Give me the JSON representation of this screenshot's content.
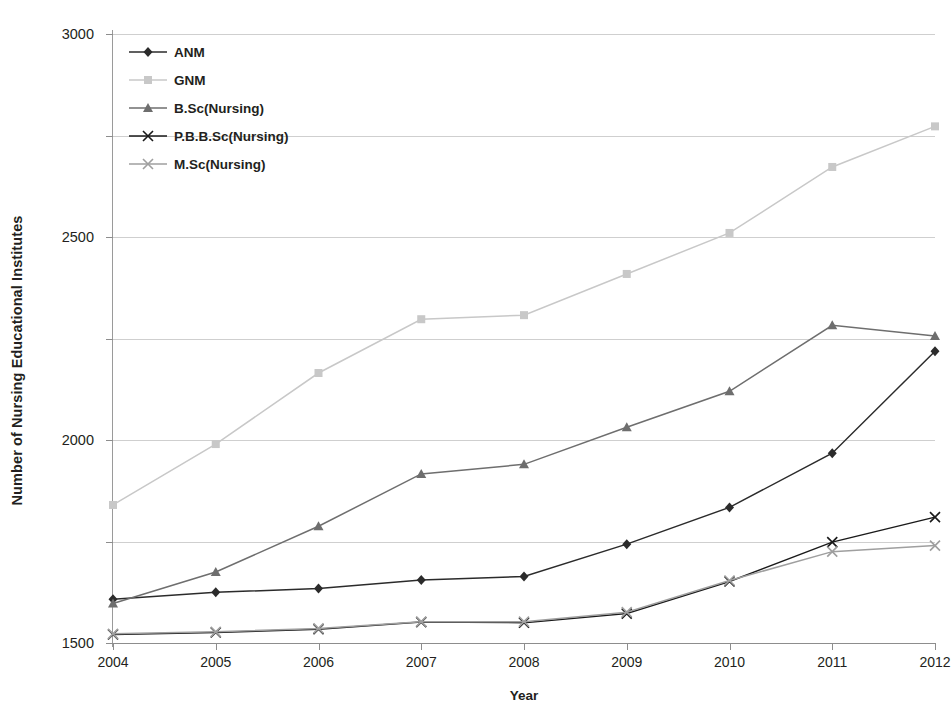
{
  "chart_data": {
    "type": "line",
    "title": "",
    "xlabel": "Year",
    "ylabel": "Number of Nursing Educational Institutes",
    "categories": [
      "2004",
      "2005",
      "2006",
      "2007",
      "2008",
      "2009",
      "2010",
      "2011",
      "2012"
    ],
    "x": [
      2004,
      2005,
      2006,
      2007,
      2008,
      2009,
      2010,
      2011,
      2012
    ],
    "ylim": [
      0,
      3000
    ],
    "yticks": [
      0,
      500,
      1000,
      1500,
      2000,
      2500,
      3000
    ],
    "ytick_labels": [
      "0",
      "500",
      "1000",
      "1500",
      "2000",
      "2500",
      "3000"
    ],
    "grid": true,
    "legend_position": "top-left",
    "series": [
      {
        "name": "ANM",
        "color": "#2b2b2b",
        "marker": "diamond",
        "values": [
          215,
          250,
          268,
          310,
          328,
          487,
          668,
          935,
          1437
        ]
      },
      {
        "name": "GNM",
        "color": "#c8c8c8",
        "marker": "square",
        "values": [
          680,
          980,
          1330,
          1595,
          1615,
          1818,
          2020,
          2345,
          2545
        ]
      },
      {
        "name": "B.Sc(Nursing)",
        "color": "#6e6e6e",
        "marker": "triangle",
        "values": [
          195,
          350,
          575,
          833,
          880,
          1063,
          1240,
          1565,
          1512
        ]
      },
      {
        "name": "P.B.B.Sc(Nursing)",
        "color": "#1a1a1a",
        "marker": "cross",
        "values": [
          42,
          52,
          68,
          103,
          100,
          145,
          303,
          497,
          620
        ]
      },
      {
        "name": "M.Sc(Nursing)",
        "color": "#9f9f9f",
        "marker": "cross",
        "values": [
          45,
          55,
          72,
          105,
          105,
          152,
          308,
          450,
          480
        ]
      }
    ]
  }
}
